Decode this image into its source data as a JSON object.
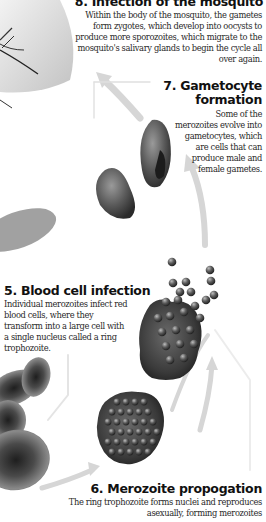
{
  "diagram": {
    "color_scheme": "grayscale",
    "stages": [
      {
        "number": "8",
        "title": "8. Infection of the mosquito",
        "body": "Within the body of the mosquito, the gametes form zygotes, which develop into oocysts to produce more sporozoites, which migrate to the mosquito's salivary glands to begin the cycle all over again."
      },
      {
        "number": "7",
        "title": "7. Gametocyte formation",
        "body": "Some of the merozoites evolve into gametocytes, which are cells that can produce male and female gametes."
      },
      {
        "number": "5",
        "title": "5. Blood cell infection",
        "body": "Individual merozoites infect red blood cells, where they transform into a large cell with a single nucleus called a ring trophozoite."
      },
      {
        "number": "6",
        "title": "6. Merozoite propogation",
        "body": "The ring trophozoite forms nuclei and reproduces asexually, forming merozoites"
      }
    ],
    "illustrations": [
      "mosquito-legs",
      "gametocyte-cells",
      "bursting-cell-with-merozoites",
      "red-blood-cells",
      "schizont-cell"
    ],
    "colors": {
      "arrow": "#d6d6d6",
      "cell_dark": "#2e2e2e",
      "cell_mid": "#7a7a7a",
      "text": "#222222"
    }
  }
}
